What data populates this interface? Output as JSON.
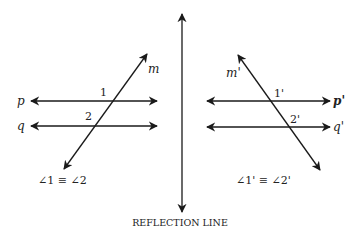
{
  "diagram": {
    "type": "geometry-reflection",
    "reflection_line": {
      "label": "REFLECTION LINE"
    },
    "original": {
      "lines": [
        {
          "name": "p",
          "label": "p"
        },
        {
          "name": "q",
          "label": "q"
        },
        {
          "name": "m",
          "label": "m"
        }
      ],
      "angles": [
        {
          "label": "1"
        },
        {
          "label": "2"
        }
      ],
      "statement": "∠1 ≡ ∠2"
    },
    "image": {
      "lines": [
        {
          "name": "p'",
          "label": "p'"
        },
        {
          "name": "q'",
          "label": "q'"
        },
        {
          "name": "m'",
          "label": "m'"
        }
      ],
      "angles": [
        {
          "label": "1'"
        },
        {
          "label": "2'"
        }
      ],
      "statement": "∠1' ≡ ∠2'"
    },
    "colors": {
      "ink": "#1a1a1a",
      "background": "#ffffff"
    }
  }
}
